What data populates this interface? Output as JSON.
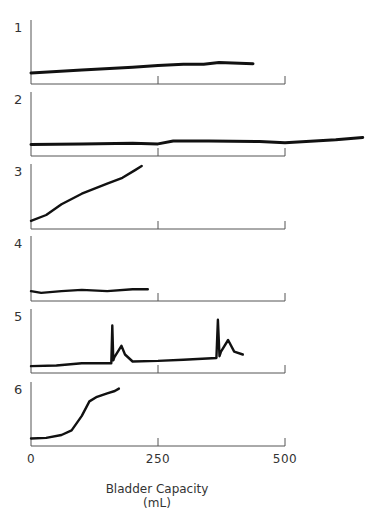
{
  "chart_data": {
    "type": "line",
    "title": "",
    "xlabel": "Bladder Capacity",
    "xlabel_unit": "(mL)",
    "ylabel": "",
    "xlim": [
      0,
      500
    ],
    "x_ticks": [
      0,
      250,
      500
    ],
    "x_tick_labels": [
      "0",
      "250",
      "500"
    ],
    "grid": false,
    "layout": "six stacked panels sharing x-axis",
    "panels": [
      {
        "label": "1",
        "description": "low, gradually rising compliance curve",
        "x": [
          0,
          100,
          200,
          250,
          300,
          340,
          370,
          437
        ],
        "y": [
          0.12,
          0.17,
          0.22,
          0.25,
          0.27,
          0.27,
          0.3,
          0.28
        ]
      },
      {
        "label": "2",
        "description": "flat normal curve extending past 500 mL",
        "x": [
          0,
          100,
          200,
          250,
          280,
          350,
          450,
          500,
          600,
          653
        ],
        "y": [
          0.13,
          0.14,
          0.15,
          0.14,
          0.19,
          0.19,
          0.18,
          0.16,
          0.21,
          0.25
        ]
      },
      {
        "label": "3",
        "description": "steep linear rise (poor compliance)",
        "x": [
          0,
          30,
          60,
          100,
          150,
          180,
          205,
          218
        ],
        "y": [
          0.07,
          0.17,
          0.35,
          0.53,
          0.7,
          0.8,
          0.93,
          1.0
        ]
      },
      {
        "label": "4",
        "description": "flat, small capacity",
        "x": [
          0,
          20,
          60,
          100,
          150,
          200,
          230
        ],
        "y": [
          0.1,
          0.07,
          0.1,
          0.12,
          0.1,
          0.13,
          0.13
        ]
      },
      {
        "label": "5",
        "description": "flat with two phasic spikes (detrusor contractions)",
        "x": [
          0,
          50,
          100,
          158,
          160,
          162,
          164,
          178,
          185,
          200,
          250,
          300,
          365,
          368,
          371,
          374,
          388,
          400,
          417
        ],
        "y": [
          0.05,
          0.06,
          0.1,
          0.1,
          0.75,
          0.15,
          0.2,
          0.4,
          0.25,
          0.13,
          0.14,
          0.16,
          0.19,
          0.85,
          0.22,
          0.3,
          0.5,
          0.3,
          0.25
        ]
      },
      {
        "label": "6",
        "description": "sigmoid rise at low volume",
        "x": [
          0,
          30,
          60,
          80,
          100,
          115,
          130,
          150,
          165,
          173
        ],
        "y": [
          0.06,
          0.07,
          0.12,
          0.2,
          0.45,
          0.7,
          0.78,
          0.84,
          0.88,
          0.92
        ]
      }
    ]
  }
}
